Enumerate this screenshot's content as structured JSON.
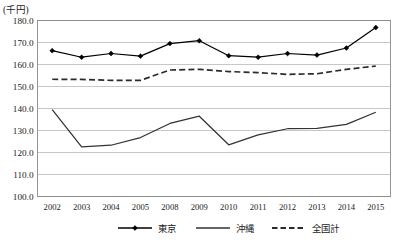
{
  "chart_data": {
    "type": "line",
    "title": "",
    "subtitle": "",
    "unit_label": "(千円)",
    "xlabel": "",
    "ylabel": "",
    "ylim": [
      100.0,
      180.0
    ],
    "y_ticks": [
      "100.0",
      "110.0",
      "120.0",
      "130.0",
      "140.0",
      "150.0",
      "160.0",
      "170.0",
      "180.0"
    ],
    "y_tick_values": [
      100.0,
      110.0,
      120.0,
      130.0,
      140.0,
      150.0,
      160.0,
      170.0,
      180.0
    ],
    "grid": true,
    "grid_axis": "y",
    "legend_position": "bottom",
    "categories": [
      "2002",
      "2003",
      "2004",
      "2005",
      "2008",
      "2009",
      "2010",
      "2011",
      "2012",
      "2013",
      "2014",
      "2015"
    ],
    "series": [
      {
        "name": "東京",
        "style": "solid-marker",
        "marker": "diamond",
        "color": "#000000",
        "values": [
          166.3,
          163.3,
          165.0,
          163.8,
          169.5,
          170.8,
          164.0,
          163.3,
          165.0,
          164.3,
          167.5,
          176.8
        ]
      },
      {
        "name": "沖縄",
        "style": "solid",
        "marker": "none",
        "color": "#333333",
        "values": [
          139.5,
          122.6,
          123.3,
          126.8,
          133.2,
          136.5,
          123.5,
          128.0,
          130.8,
          131.0,
          132.8,
          138.3
        ]
      },
      {
        "name": "全国計",
        "style": "dashed",
        "marker": "none",
        "color": "#2b2b2b",
        "values": [
          153.3,
          153.2,
          152.8,
          152.8,
          157.5,
          157.8,
          156.8,
          156.3,
          155.5,
          155.8,
          157.8,
          159.3
        ]
      }
    ]
  },
  "legend": {
    "items": [
      {
        "label": "東京",
        "style": "solid-marker"
      },
      {
        "label": "沖縄",
        "style": "solid"
      },
      {
        "label": "全国計",
        "style": "dashed"
      }
    ]
  },
  "colors": {
    "axis": "#7a7a7a",
    "grid": "#b9b9b9",
    "plot_border": "#8a8a8a",
    "tokyo": "#000000",
    "okinawa": "#333333",
    "national": "#2b2b2b",
    "background": "#ffffff"
  }
}
